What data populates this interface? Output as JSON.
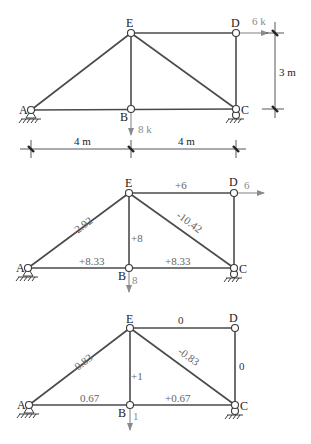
{
  "diagrams": [
    {
      "id": "loaded_truss",
      "nodes": {
        "A": "A",
        "B": "B",
        "C": "C",
        "D": "D",
        "E": "E"
      },
      "loads": {
        "D": "6 k",
        "B": "8 k"
      },
      "dimensions": {
        "span_left": "4 m",
        "span_right": "4 m",
        "height": "3 m"
      }
    },
    {
      "id": "real_forces",
      "nodes": {
        "A": "A",
        "B": "B",
        "C": "C",
        "D": "D",
        "E": "E"
      },
      "loads": {
        "D": "6",
        "B": "8"
      },
      "members": {
        "AE": "-2.92",
        "ED": "+6",
        "EB": "+8",
        "EC": "-10.42",
        "AB": "+8.33",
        "BC": "+8.33"
      }
    },
    {
      "id": "virtual_forces",
      "nodes": {
        "A": "A",
        "B": "B",
        "C": "C",
        "D": "D",
        "E": "E"
      },
      "loads": {
        "B": "1"
      },
      "members": {
        "AE": "-0.83",
        "ED": "0",
        "EB": "+1",
        "EC": "-0.83",
        "AB": "0.67",
        "BC": "+0.67",
        "DC": "0"
      }
    }
  ],
  "colors": {
    "member": "#4a4a4a",
    "load": "#8a8a8a",
    "text": "#222222"
  }
}
